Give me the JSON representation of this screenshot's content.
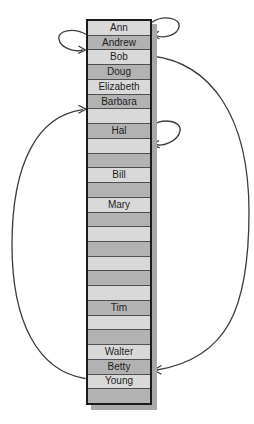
{
  "figure": {
    "type": "hash-table-probing-diagram",
    "background_color": "#ffffff",
    "array": {
      "colors": {
        "light_cell": "#d9d9d9",
        "dark_cell": "#b2b2b2",
        "outer_border": "#1b1b1b",
        "cell_separator": "#505050",
        "drop_shadow": "#a8a8a8",
        "text": "#1d1d1d"
      },
      "rows": [
        {
          "index": 1,
          "label": "Ann",
          "shade": "light"
        },
        {
          "index": 2,
          "label": "Andrew",
          "shade": "dark"
        },
        {
          "index": 3,
          "label": "Bob",
          "shade": "light"
        },
        {
          "index": 4,
          "label": "Doug",
          "shade": "dark"
        },
        {
          "index": 5,
          "label": "Elizabeth",
          "shade": "light"
        },
        {
          "index": 6,
          "label": "Barbara",
          "shade": "dark"
        },
        {
          "index": 7,
          "label": "",
          "shade": "light"
        },
        {
          "index": 8,
          "label": "Hal",
          "shade": "dark"
        },
        {
          "index": 9,
          "label": "",
          "shade": "light"
        },
        {
          "index": 10,
          "label": "",
          "shade": "dark"
        },
        {
          "index": 11,
          "label": "Bill",
          "shade": "light"
        },
        {
          "index": 12,
          "label": "",
          "shade": "dark"
        },
        {
          "index": 13,
          "label": "Mary",
          "shade": "light"
        },
        {
          "index": 14,
          "label": "",
          "shade": "dark"
        },
        {
          "index": 15,
          "label": "",
          "shade": "light"
        },
        {
          "index": 16,
          "label": "",
          "shade": "dark"
        },
        {
          "index": 17,
          "label": "",
          "shade": "light"
        },
        {
          "index": 18,
          "label": "",
          "shade": "dark"
        },
        {
          "index": 19,
          "label": "",
          "shade": "light"
        },
        {
          "index": 20,
          "label": "Tim",
          "shade": "dark"
        },
        {
          "index": 21,
          "label": "",
          "shade": "light"
        },
        {
          "index": 22,
          "label": "",
          "shade": "dark"
        },
        {
          "index": 23,
          "label": "Walter",
          "shade": "light"
        },
        {
          "index": 24,
          "label": "Betty",
          "shade": "dark"
        },
        {
          "index": 25,
          "label": "Young",
          "shade": "light"
        },
        {
          "index": 26,
          "label": "",
          "shade": "dark"
        }
      ]
    },
    "arrows": {
      "color": "#3c3c3c",
      "items": [
        {
          "id": "ann-to-andrew",
          "side": "right",
          "from_row": 1,
          "to_row": 2,
          "style": "small-loop"
        },
        {
          "id": "andrew-to-bob",
          "side": "left",
          "from_row": 2,
          "to_row": 3,
          "style": "small-loop"
        },
        {
          "id": "hal-to-next-slot",
          "side": "right",
          "from_row": 8,
          "to_row": 9,
          "style": "small-loop"
        },
        {
          "id": "bob-to-betty",
          "side": "right",
          "from_row": 3,
          "to_row": 24,
          "style": "long-curve"
        },
        {
          "id": "young-to-slot-7",
          "side": "left",
          "from_row": 25,
          "to_row": 7,
          "style": "long-curve"
        }
      ]
    }
  }
}
